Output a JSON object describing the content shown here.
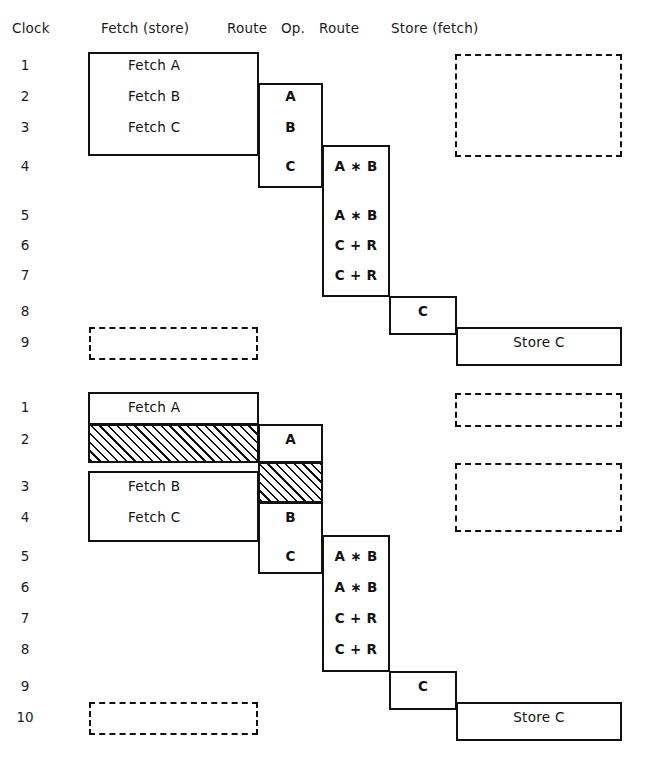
{
  "headers": [
    {
      "label": "Clock",
      "x": 12,
      "y": 20
    },
    {
      "label": "Fetch (store)",
      "x": 101,
      "y": 20
    },
    {
      "label": "Route",
      "x": 227,
      "y": 20
    },
    {
      "label": "Op.",
      "x": 281,
      "y": 20
    },
    {
      "label": "Route",
      "x": 319,
      "y": 20
    },
    {
      "label": "Store (fetch)",
      "x": 391,
      "y": 20
    }
  ],
  "diagram1": {
    "clocks": [
      {
        "label": "1",
        "y": 57
      },
      {
        "label": "2",
        "y": 88
      },
      {
        "label": "3",
        "y": 119
      },
      {
        "label": "4",
        "y": 158
      },
      {
        "label": "5",
        "y": 207
      },
      {
        "label": "6",
        "y": 237
      },
      {
        "label": "7",
        "y": 267
      },
      {
        "label": "8",
        "y": 303
      },
      {
        "label": "9",
        "y": 334
      }
    ],
    "boxes": [
      {
        "name": "fetch-stage-box",
        "x": 88,
        "y": 52,
        "w": 171,
        "h": 104
      },
      {
        "name": "route1-stage-box",
        "x": 258,
        "y": 83,
        "w": 65,
        "h": 105
      },
      {
        "name": "op-stage-box",
        "x": 322,
        "y": 145,
        "w": 68,
        "h": 152
      },
      {
        "name": "route2-stage-box",
        "x": 389,
        "y": 296,
        "w": 68,
        "h": 39
      },
      {
        "name": "store-stage-box",
        "x": 456,
        "y": 327,
        "w": 166,
        "h": 39
      }
    ],
    "dashed_boxes": [
      {
        "name": "store-idle-box",
        "x": 455,
        "y": 54,
        "w": 167,
        "h": 103
      },
      {
        "name": "fetch-idle-box",
        "x": 89,
        "y": 327,
        "w": 169,
        "h": 33
      }
    ],
    "cells": [
      {
        "name": "fetch-a",
        "text": "Fetch   A",
        "x": 128,
        "y": 57,
        "w": 100,
        "style": "lbl"
      },
      {
        "name": "fetch-b",
        "text": "Fetch   B",
        "x": 128,
        "y": 88,
        "w": 100,
        "style": "lbl"
      },
      {
        "name": "fetch-c",
        "text": "Fetch   C",
        "x": 128,
        "y": 119,
        "w": 100,
        "style": "lbl"
      },
      {
        "name": "route-a",
        "text": "A",
        "x": 258,
        "y": 88,
        "w": 65,
        "style": "ctr"
      },
      {
        "name": "route-b",
        "text": "B",
        "x": 258,
        "y": 119,
        "w": 65,
        "style": "ctr"
      },
      {
        "name": "route-c",
        "text": "C",
        "x": 258,
        "y": 158,
        "w": 65,
        "style": "ctr"
      },
      {
        "name": "op-mul-1",
        "text": "A ∗ B",
        "x": 322,
        "y": 158,
        "w": 68,
        "style": "ctr"
      },
      {
        "name": "op-mul-2",
        "text": "A ∗ B",
        "x": 322,
        "y": 207,
        "w": 68,
        "style": "ctr"
      },
      {
        "name": "op-add-1",
        "text": "C + R",
        "x": 322,
        "y": 237,
        "w": 68,
        "style": "ctr"
      },
      {
        "name": "op-add-2",
        "text": "C + R",
        "x": 322,
        "y": 267,
        "w": 68,
        "style": "ctr"
      },
      {
        "name": "route2-c",
        "text": "C",
        "x": 389,
        "y": 303,
        "w": 68,
        "style": "ctr"
      },
      {
        "name": "store-c",
        "text": "Store   C",
        "x": 456,
        "y": 334,
        "w": 166,
        "style": "lbl ctr"
      }
    ],
    "hatches": []
  },
  "diagram2": {
    "clocks": [
      {
        "label": "1",
        "y": 399
      },
      {
        "label": "2",
        "y": 431
      },
      {
        "label": "3",
        "y": 478
      },
      {
        "label": "4",
        "y": 509
      },
      {
        "label": "5",
        "y": 548
      },
      {
        "label": "6",
        "y": 579
      },
      {
        "label": "7",
        "y": 610
      },
      {
        "label": "8",
        "y": 641
      },
      {
        "label": "9",
        "y": 678
      },
      {
        "label": "10",
        "y": 709
      }
    ],
    "boxes": [
      {
        "name": "fetch-a-box",
        "x": 88,
        "y": 392,
        "w": 171,
        "h": 33
      },
      {
        "name": "fetch-stage-box",
        "x": 88,
        "y": 471,
        "w": 171,
        "h": 71
      },
      {
        "name": "route1-a-box",
        "x": 258,
        "y": 424,
        "w": 65,
        "h": 39
      },
      {
        "name": "route1-stage-box",
        "x": 258,
        "y": 502,
        "w": 65,
        "h": 72
      },
      {
        "name": "op-stage-box",
        "x": 322,
        "y": 535,
        "w": 68,
        "h": 137
      },
      {
        "name": "route2-stage-box",
        "x": 389,
        "y": 671,
        "w": 68,
        "h": 39
      },
      {
        "name": "store-stage-box",
        "x": 456,
        "y": 702,
        "w": 166,
        "h": 39
      }
    ],
    "dashed_boxes": [
      {
        "name": "store-idle-box-1",
        "x": 455,
        "y": 393,
        "w": 167,
        "h": 34
      },
      {
        "name": "store-idle-box-2",
        "x": 455,
        "y": 463,
        "w": 167,
        "h": 69
      },
      {
        "name": "fetch-idle-box",
        "x": 89,
        "y": 702,
        "w": 169,
        "h": 33
      }
    ],
    "hatches": [
      {
        "name": "fetch-stall-hatch",
        "x": 88,
        "y": 424,
        "w": 171,
        "h": 39
      },
      {
        "name": "route-stall-hatch",
        "x": 258,
        "y": 462,
        "w": 65,
        "h": 41
      }
    ],
    "cells": [
      {
        "name": "fetch-a",
        "text": "Fetch   A",
        "x": 128,
        "y": 399,
        "w": 100,
        "style": "lbl"
      },
      {
        "name": "fetch-b",
        "text": "Fetch   B",
        "x": 128,
        "y": 478,
        "w": 100,
        "style": "lbl"
      },
      {
        "name": "fetch-c",
        "text": "Fetch   C",
        "x": 128,
        "y": 509,
        "w": 100,
        "style": "lbl"
      },
      {
        "name": "route-a",
        "text": "A",
        "x": 258,
        "y": 431,
        "w": 65,
        "style": "ctr"
      },
      {
        "name": "route-b",
        "text": "B",
        "x": 258,
        "y": 509,
        "w": 65,
        "style": "ctr"
      },
      {
        "name": "route-c",
        "text": "C",
        "x": 258,
        "y": 548,
        "w": 65,
        "style": "ctr"
      },
      {
        "name": "op-mul-1",
        "text": "A ∗ B",
        "x": 322,
        "y": 548,
        "w": 68,
        "style": "ctr"
      },
      {
        "name": "op-mul-2",
        "text": "A ∗ B",
        "x": 322,
        "y": 579,
        "w": 68,
        "style": "ctr"
      },
      {
        "name": "op-add-1",
        "text": "C + R",
        "x": 322,
        "y": 610,
        "w": 68,
        "style": "ctr"
      },
      {
        "name": "op-add-2",
        "text": "C + R",
        "x": 322,
        "y": 641,
        "w": 68,
        "style": "ctr"
      },
      {
        "name": "route2-c",
        "text": "C",
        "x": 389,
        "y": 678,
        "w": 68,
        "style": "ctr"
      },
      {
        "name": "store-c",
        "text": "Store   C",
        "x": 456,
        "y": 709,
        "w": 166,
        "style": "lbl ctr"
      }
    ]
  },
  "chart_data": {
    "type": "table",
    "columns": [
      "Clock",
      "Fetch (store)",
      "Route",
      "Op.",
      "Route",
      "Store (fetch)"
    ],
    "diagrams": [
      {
        "name": "ideal-pipeline",
        "clock_range": [
          1,
          9
        ],
        "rows": [
          {
            "clock": 1,
            "fetch": "Fetch   A",
            "route1": "",
            "op": "",
            "route2": "",
            "store": "idle"
          },
          {
            "clock": 2,
            "fetch": "Fetch   B",
            "route1": "A",
            "op": "",
            "route2": "",
            "store": "idle"
          },
          {
            "clock": 3,
            "fetch": "Fetch   C",
            "route1": "B",
            "op": "",
            "route2": "",
            "store": "idle"
          },
          {
            "clock": 4,
            "fetch": "",
            "route1": "C",
            "op": "A * B",
            "route2": "",
            "store": ""
          },
          {
            "clock": 5,
            "fetch": "",
            "route1": "",
            "op": "A * B",
            "route2": "",
            "store": ""
          },
          {
            "clock": 6,
            "fetch": "",
            "route1": "",
            "op": "C + R",
            "route2": "",
            "store": ""
          },
          {
            "clock": 7,
            "fetch": "",
            "route1": "",
            "op": "C + R",
            "route2": "",
            "store": ""
          },
          {
            "clock": 8,
            "fetch": "",
            "route1": "",
            "op": "",
            "route2": "C",
            "store": ""
          },
          {
            "clock": 9,
            "fetch": "idle",
            "route1": "",
            "op": "",
            "route2": "",
            "store": "Store   C"
          }
        ]
      },
      {
        "name": "stalled-pipeline",
        "clock_range": [
          1,
          10
        ],
        "rows": [
          {
            "clock": 1,
            "fetch": "Fetch   A",
            "route1": "",
            "op": "",
            "route2": "",
            "store": "idle"
          },
          {
            "clock": 2,
            "fetch": "stall",
            "route1": "A",
            "op": "",
            "route2": "",
            "store": ""
          },
          {
            "clock": 3,
            "fetch": "Fetch   B",
            "route1": "stall",
            "op": "",
            "route2": "",
            "store": "idle"
          },
          {
            "clock": 4,
            "fetch": "Fetch   C",
            "route1": "B",
            "op": "",
            "route2": "",
            "store": "idle"
          },
          {
            "clock": 5,
            "fetch": "",
            "route1": "C",
            "op": "A * B",
            "route2": "",
            "store": ""
          },
          {
            "clock": 6,
            "fetch": "",
            "route1": "",
            "op": "A * B",
            "route2": "",
            "store": ""
          },
          {
            "clock": 7,
            "fetch": "",
            "route1": "",
            "op": "C + R",
            "route2": "",
            "store": ""
          },
          {
            "clock": 8,
            "fetch": "",
            "route1": "",
            "op": "C + R",
            "route2": "",
            "store": ""
          },
          {
            "clock": 9,
            "fetch": "",
            "route1": "",
            "op": "",
            "route2": "C",
            "store": ""
          },
          {
            "clock": 10,
            "fetch": "idle",
            "route1": "",
            "op": "",
            "route2": "",
            "store": "Store   C"
          }
        ]
      }
    ],
    "legend": {
      "solid": "active pipeline stage",
      "dashed": "idle / unused stage",
      "hatched": "stalled (wait) cycle"
    }
  }
}
